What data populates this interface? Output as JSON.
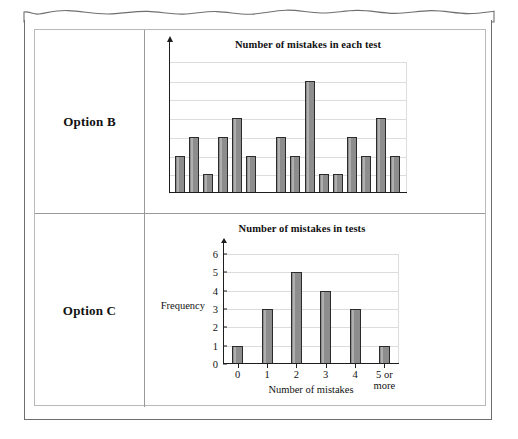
{
  "page": {
    "rows": [
      {
        "label": "Option B"
      },
      {
        "label": "Option C"
      }
    ]
  },
  "chart_data": [
    {
      "id": "option-b",
      "type": "bar",
      "title": "Number of mistakes in each test",
      "xlabel": "",
      "ylabel": "",
      "categories": [
        "1",
        "2",
        "3",
        "4",
        "5",
        "6",
        "7",
        "8",
        "9",
        "10",
        "11",
        "12",
        "13",
        "14",
        "15"
      ],
      "values": [
        2,
        3,
        1,
        3,
        4,
        2,
        3,
        2,
        6,
        1,
        1,
        3,
        2,
        4,
        2
      ],
      "ylim": [
        0,
        7
      ],
      "grid": true,
      "gridlines": [
        1,
        2,
        3,
        4,
        5,
        6
      ],
      "tick_labels_shown": false,
      "legend": "none",
      "note": "Unlabelled axes; bar heights read against six evenly spaced horizontal gridlines. A wider gap separates the 6th and 7th bars."
    },
    {
      "id": "option-c",
      "type": "bar",
      "title": "Number of mistakes in tests",
      "xlabel": "Number of mistakes",
      "ylabel": "Frequency",
      "categories": [
        "0",
        "1",
        "2",
        "3",
        "4",
        "5 or\nmore"
      ],
      "values": [
        1,
        3,
        5,
        4,
        3,
        1
      ],
      "ylim": [
        0,
        6
      ],
      "yticks": [
        "0",
        "1",
        "2",
        "3",
        "4",
        "5",
        "6"
      ],
      "grid": true,
      "legend": "none"
    }
  ],
  "colors": {
    "bar_fill": "#8d8d8d",
    "bar_stroke": "#2b2b2b",
    "gridline": "#dcdcdc",
    "axis": "#1d1d1d",
    "table_border": "#9a9a9a",
    "sheet_border": "#6f6f6f",
    "text": "#111111"
  }
}
